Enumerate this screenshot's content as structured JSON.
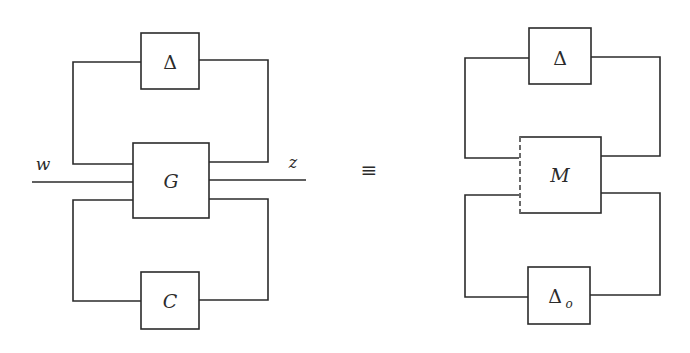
{
  "diagram": {
    "left": {
      "blocks": {
        "delta": "Δ",
        "plant": "G",
        "controller": "C"
      },
      "signals": {
        "input": "w",
        "output": "z"
      }
    },
    "equivalence": "≡",
    "right": {
      "blocks": {
        "delta": "Δ",
        "plant": "M",
        "delta_o": "Δ",
        "delta_o_subscript": "o"
      }
    },
    "colors": {
      "stroke": "#2b2b2b",
      "background": "#ffffff"
    }
  }
}
